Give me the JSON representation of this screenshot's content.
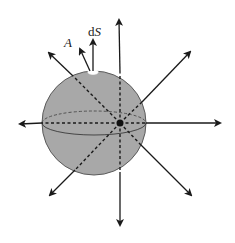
{
  "figure": {
    "labels": {
      "area_vector": "A",
      "surface_element_d": "d",
      "surface_element_S": "S"
    },
    "colors": {
      "sphere_fill": "#a8a8a8",
      "sphere_stroke": "#5a5a5a",
      "line": "#1a1a1a",
      "patch": "#ffffff"
    },
    "sphere": {
      "cx": 94,
      "cy": 123,
      "r": 52
    },
    "charge": {
      "x": 120,
      "y": 123,
      "r": 3.5
    },
    "field_lines": [
      {
        "name": "up",
        "tip": [
          119,
          18
        ]
      },
      {
        "name": "down",
        "tip": [
          120,
          227
        ]
      },
      {
        "name": "left",
        "tip": [
          18,
          124
        ]
      },
      {
        "name": "right",
        "tip": [
          222,
          123
        ]
      },
      {
        "name": "upper-left",
        "tip": [
          47,
          51
        ]
      },
      {
        "name": "upper-right",
        "tip": [
          192,
          50
        ]
      },
      {
        "name": "lower-left",
        "tip": [
          48,
          197
        ]
      },
      {
        "name": "lower-right",
        "tip": [
          193,
          197
        ]
      }
    ]
  }
}
